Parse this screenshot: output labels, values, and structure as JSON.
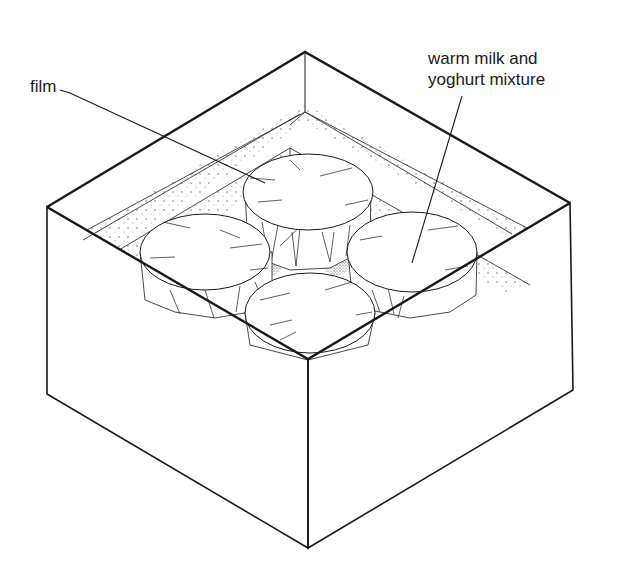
{
  "diagram": {
    "labels": {
      "film": "film",
      "mixture_line1": "warm milk and",
      "mixture_line2": "yoghurt mixture"
    },
    "colors": {
      "ink": "#1a1a1a",
      "background": "#ffffff",
      "stipple": "#555555"
    }
  }
}
